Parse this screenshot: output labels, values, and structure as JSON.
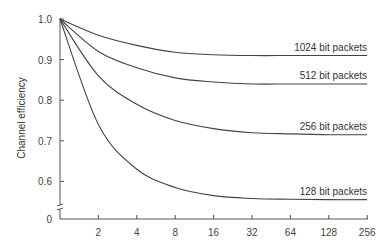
{
  "chart_data": {
    "type": "line",
    "title": "",
    "xlabel": "",
    "ylabel": "Channel efficiency",
    "x_ticks": [
      "2",
      "4",
      "8",
      "16",
      "32",
      "64",
      "128",
      "256"
    ],
    "y_ticks": [
      "1.0",
      "0.9",
      "0.8",
      "0.7",
      "0.6",
      "0"
    ],
    "ylim": [
      0,
      1.0
    ],
    "y_axis_break": true,
    "grid": false,
    "legend_position": "inline-right",
    "x": [
      1,
      2,
      4,
      8,
      16,
      32,
      64,
      128,
      256
    ],
    "series": [
      {
        "name": "1024 bit packets",
        "values": [
          1.0,
          0.96,
          0.935,
          0.918,
          0.912,
          0.91,
          0.91,
          0.91,
          0.91
        ]
      },
      {
        "name": "512 bit packets",
        "values": [
          1.0,
          0.92,
          0.88,
          0.855,
          0.845,
          0.84,
          0.84,
          0.84,
          0.84
        ]
      },
      {
        "name": "256 bit packets",
        "values": [
          1.0,
          0.86,
          0.79,
          0.75,
          0.73,
          0.72,
          0.717,
          0.715,
          0.715
        ]
      },
      {
        "name": "128 bit packets",
        "values": [
          1.0,
          0.74,
          0.63,
          0.585,
          0.565,
          0.558,
          0.556,
          0.555,
          0.555
        ]
      }
    ]
  }
}
